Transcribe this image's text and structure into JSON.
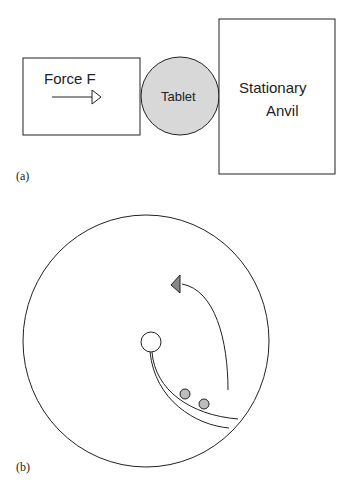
{
  "panel_a": {
    "label": "(a)",
    "force_box_label": "Force F",
    "tablet_label": "Tablet",
    "anvil_label_line1": "Stationary",
    "anvil_label_line2": "Anvil",
    "colors": {
      "tablet_fill": "#d8d8d8",
      "stroke": "#222222"
    }
  },
  "panel_b": {
    "label": "(b)",
    "colors": {
      "particle_fill": "#bdbdbd",
      "arrow_fill": "#888888",
      "stroke": "#222222"
    }
  }
}
